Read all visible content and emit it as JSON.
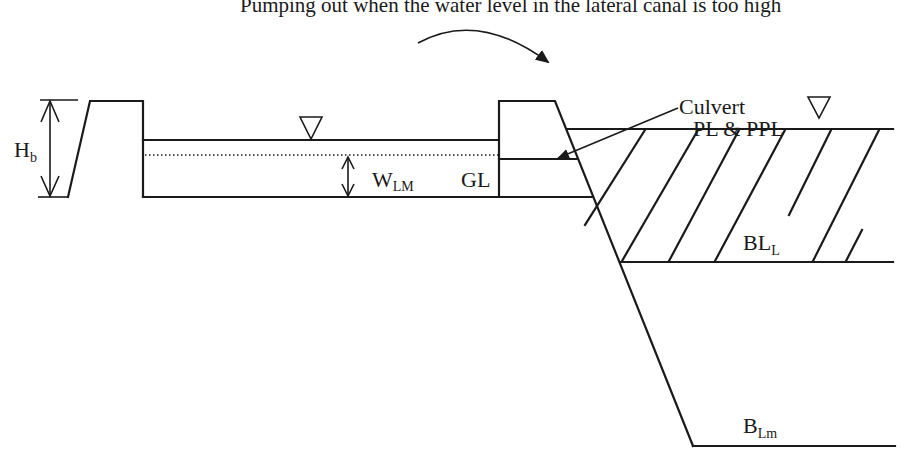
{
  "caption": "Pumping out when the water level in the lateral canal is too high",
  "labels": {
    "hb_main": "H",
    "hb_sub": "b",
    "wlm_main": "W",
    "wlm_sub": "LM",
    "gl": "GL",
    "culvert": "Culvert",
    "pl_ppl": "PL & PPL",
    "bll_main": "BL",
    "bll_sub": "L",
    "blm_main": "B",
    "blm_sub": "Lm"
  },
  "symbols": {
    "water_level_left": "water-level-triangle",
    "water_level_right": "water-level-triangle"
  },
  "colors": {
    "line": "#1a1a1a",
    "background": "#ffffff"
  }
}
